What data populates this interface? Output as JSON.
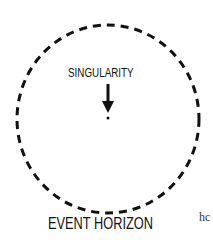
{
  "diagram": {
    "singularity_label": "SINGULARITY",
    "event_horizon_label": "EVENT HORIZON",
    "cropped_text": "hc",
    "colors": {
      "stroke": "#111111",
      "background": "#ffffff"
    }
  }
}
